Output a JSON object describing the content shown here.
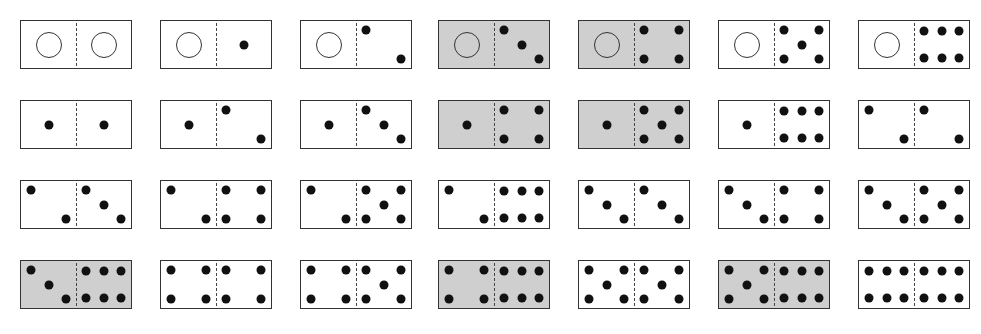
{
  "colors": {
    "shaded_fill": "#cfcfcf",
    "pip": "#111111",
    "border": "#333333"
  },
  "layout": {
    "columns_x": [
      20,
      160,
      300,
      438,
      578,
      718,
      858
    ],
    "rows_y": [
      20,
      100,
      180,
      260
    ]
  },
  "dominoes": [
    {
      "row": 0,
      "col": 0,
      "left": 0,
      "right": 0,
      "shaded": false
    },
    {
      "row": 0,
      "col": 1,
      "left": 0,
      "right": 1,
      "shaded": false
    },
    {
      "row": 0,
      "col": 2,
      "left": 0,
      "right": 2,
      "shaded": false
    },
    {
      "row": 0,
      "col": 3,
      "left": 0,
      "right": 3,
      "shaded": true
    },
    {
      "row": 0,
      "col": 4,
      "left": 0,
      "right": 4,
      "shaded": true
    },
    {
      "row": 0,
      "col": 5,
      "left": 0,
      "right": 5,
      "shaded": false
    },
    {
      "row": 0,
      "col": 6,
      "left": 0,
      "right": 6,
      "shaded": false
    },
    {
      "row": 1,
      "col": 0,
      "left": 1,
      "right": 1,
      "shaded": false
    },
    {
      "row": 1,
      "col": 1,
      "left": 1,
      "right": 2,
      "shaded": false
    },
    {
      "row": 1,
      "col": 2,
      "left": 1,
      "right": 3,
      "shaded": false
    },
    {
      "row": 1,
      "col": 3,
      "left": 1,
      "right": 4,
      "shaded": true
    },
    {
      "row": 1,
      "col": 4,
      "left": 1,
      "right": 5,
      "shaded": true
    },
    {
      "row": 1,
      "col": 5,
      "left": 1,
      "right": 6,
      "shaded": false
    },
    {
      "row": 1,
      "col": 6,
      "left": 2,
      "right": 2,
      "shaded": false
    },
    {
      "row": 2,
      "col": 0,
      "left": 2,
      "right": 3,
      "shaded": false
    },
    {
      "row": 2,
      "col": 1,
      "left": 2,
      "right": 4,
      "shaded": false
    },
    {
      "row": 2,
      "col": 2,
      "left": 2,
      "right": 5,
      "shaded": false
    },
    {
      "row": 2,
      "col": 3,
      "left": 2,
      "right": 6,
      "shaded": false
    },
    {
      "row": 2,
      "col": 4,
      "left": 3,
      "right": 3,
      "shaded": false
    },
    {
      "row": 2,
      "col": 5,
      "left": 3,
      "right": 4,
      "shaded": false
    },
    {
      "row": 2,
      "col": 6,
      "left": 3,
      "right": 5,
      "shaded": false
    },
    {
      "row": 3,
      "col": 0,
      "left": 3,
      "right": 6,
      "shaded": true
    },
    {
      "row": 3,
      "col": 1,
      "left": 4,
      "right": 4,
      "shaded": false
    },
    {
      "row": 3,
      "col": 2,
      "left": 4,
      "right": 5,
      "shaded": false
    },
    {
      "row": 3,
      "col": 3,
      "left": 4,
      "right": 6,
      "shaded": true
    },
    {
      "row": 3,
      "col": 4,
      "left": 5,
      "right": 5,
      "shaded": false
    },
    {
      "row": 3,
      "col": 5,
      "left": 5,
      "right": 6,
      "shaded": true
    },
    {
      "row": 3,
      "col": 6,
      "left": 6,
      "right": 6,
      "shaded": false
    }
  ],
  "pip_patterns": {
    "0": [],
    "1": [
      [
        50,
        50
      ]
    ],
    "2": [
      [
        18,
        20
      ],
      [
        82,
        80
      ]
    ],
    "3": [
      [
        18,
        20
      ],
      [
        50,
        50
      ],
      [
        82,
        80
      ]
    ],
    "4": [
      [
        18,
        20
      ],
      [
        82,
        20
      ],
      [
        18,
        80
      ],
      [
        82,
        80
      ]
    ],
    "5": [
      [
        18,
        20
      ],
      [
        82,
        20
      ],
      [
        50,
        50
      ],
      [
        18,
        80
      ],
      [
        82,
        80
      ]
    ],
    "6": [
      [
        18,
        22
      ],
      [
        50,
        22
      ],
      [
        82,
        22
      ],
      [
        18,
        78
      ],
      [
        50,
        78
      ],
      [
        82,
        78
      ]
    ]
  }
}
